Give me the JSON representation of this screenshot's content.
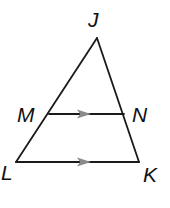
{
  "diagram": {
    "type": "triangle-with-parallel-segment",
    "vertices": {
      "J": {
        "label": "J",
        "x": 97,
        "y": 38
      },
      "M": {
        "label": "M",
        "x": 49,
        "y": 114
      },
      "N": {
        "label": "N",
        "x": 124,
        "y": 114
      },
      "L": {
        "label": "L",
        "x": 16,
        "y": 162
      },
      "K": {
        "label": "K",
        "x": 139,
        "y": 162
      }
    },
    "segments": [
      {
        "from": "J",
        "to": "L"
      },
      {
        "from": "J",
        "to": "K"
      },
      {
        "from": "M",
        "to": "N",
        "parallel_mark": true
      },
      {
        "from": "L",
        "to": "K",
        "parallel_mark": true
      }
    ],
    "relationship": "MN ∥ LK",
    "colors": {
      "line": "#1a1a1a",
      "arrow": "#8a8a8a",
      "label": "#111111"
    }
  }
}
